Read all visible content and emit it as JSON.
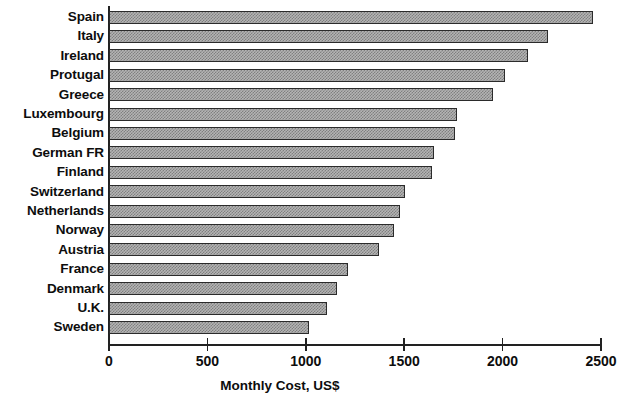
{
  "chart_data": {
    "type": "bar",
    "orientation": "horizontal",
    "title": "",
    "xlabel": "Monthly Cost, US$",
    "ylabel": "",
    "xlim": [
      0,
      2500
    ],
    "xticks": [
      0,
      500,
      1000,
      1500,
      2000,
      2500
    ],
    "xtick_labels": [
      "0",
      "500",
      "1000",
      "1500",
      "2000",
      "2500"
    ],
    "grid": false,
    "legend": null,
    "categories": [
      "Spain",
      "Italy",
      "Ireland",
      "Protugal",
      "Greece",
      "Luxembourg",
      "Belgium",
      "German FR",
      "Finland",
      "Switzerland",
      "Netherlands",
      "Norway",
      "Austria",
      "France",
      "Denmark",
      "U.K.",
      "Sweden"
    ],
    "values": [
      2460,
      2230,
      2130,
      2010,
      1950,
      1770,
      1760,
      1650,
      1640,
      1505,
      1480,
      1450,
      1370,
      1215,
      1160,
      1110,
      1015
    ],
    "bar_color": "#b4b4b4",
    "bar_edge_color": "#2b2b2b",
    "axis_color": "#222222"
  }
}
